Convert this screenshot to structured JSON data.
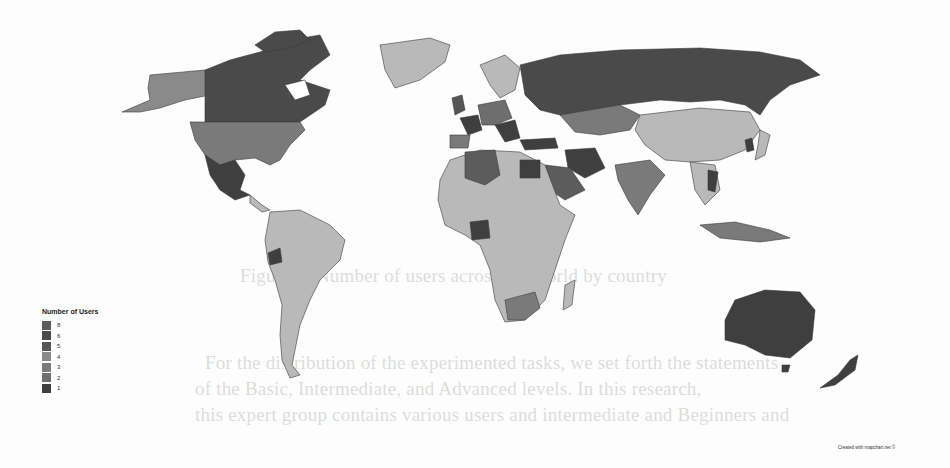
{
  "map": {
    "title": "Number of Users",
    "credit": "Created with mapchart.net ©",
    "background": "#ffffff",
    "no_data_color": "#b9b9b9",
    "legend": [
      {
        "label": "8",
        "color": "#5c5c5c"
      },
      {
        "label": "6",
        "color": "#4a4a4a"
      },
      {
        "label": "5",
        "color": "#555555"
      },
      {
        "label": "4",
        "color": "#8a8a8a"
      },
      {
        "label": "3",
        "color": "#7a7a7a"
      },
      {
        "label": "2",
        "color": "#6e6e6e"
      },
      {
        "label": "1",
        "color": "#3f3f3f"
      }
    ],
    "highlighted_regions": [
      {
        "region": "Canada",
        "shade": "dark"
      },
      {
        "region": "Mexico",
        "shade": "dark"
      },
      {
        "region": "Russia",
        "shade": "dark"
      },
      {
        "region": "Australia",
        "shade": "dark"
      },
      {
        "region": "New Zealand",
        "shade": "dark"
      },
      {
        "region": "Iran",
        "shade": "dark"
      },
      {
        "region": "Egypt",
        "shade": "dark"
      },
      {
        "region": "Nigeria",
        "shade": "dark"
      },
      {
        "region": "Ecuador",
        "shade": "dark"
      },
      {
        "region": "United States",
        "shade": "medium"
      },
      {
        "region": "Alaska",
        "shade": "medium"
      },
      {
        "region": "India",
        "shade": "medium"
      },
      {
        "region": "Algeria",
        "shade": "medium"
      },
      {
        "region": "Saudi Arabia",
        "shade": "medium"
      },
      {
        "region": "South Africa",
        "shade": "medium"
      },
      {
        "region": "Kazakhstan",
        "shade": "medium"
      },
      {
        "region": "China",
        "shade": "light"
      },
      {
        "region": "Brazil",
        "shade": "light"
      },
      {
        "region": "Greenland",
        "shade": "light"
      }
    ]
  },
  "page_bleed_text": [
    "Figure 4: Number of users across the world by country",
    "For the distribution of the experimented tasks, we set forth the statements",
    "of the Basic, Intermediate, and Advanced levels. In this research,",
    "this expert group contains various users and intermediate and Beginners and"
  ]
}
